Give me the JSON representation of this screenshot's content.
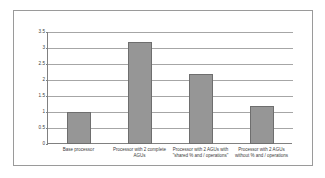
{
  "chart_data": {
    "type": "bar",
    "title": "",
    "xlabel": "",
    "ylabel": "",
    "categories": [
      "Base processor",
      "Processor with 2 complete AGUs",
      "Processor with 2 AGUs with \"shared % and / operations\"",
      "Processor with 2 AGUs without % and / operations"
    ],
    "values": [
      1,
      3.2,
      2.2,
      1.2
    ],
    "ylim": [
      0,
      3.5
    ],
    "yticks": [
      "0",
      "0.5",
      "1",
      "1.5",
      "2",
      "2.5",
      "3",
      "3.5"
    ],
    "ytick_values": [
      0,
      0.5,
      1,
      1.5,
      2,
      2.5,
      3,
      3.5
    ],
    "grid": true,
    "legend": false,
    "series": [
      {
        "name": "Speedup",
        "values": [
          1,
          3.2,
          2.2,
          1.2
        ]
      }
    ],
    "colors": {
      "bar_fill": "#969696",
      "bar_border": "#6e6e6e",
      "gridline": "#a6a6a6",
      "axis": "#808080",
      "frame": "#9a9a9a",
      "text": "#3a3a3a",
      "background": "#ffffff"
    }
  }
}
